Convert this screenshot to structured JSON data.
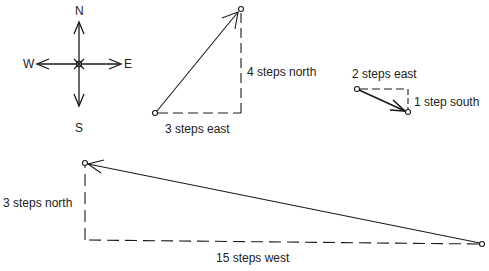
{
  "compass": {
    "north": "N",
    "south": "S",
    "east": "E",
    "west": "W"
  },
  "diagrams": [
    {
      "id": "triangle-1",
      "legs": [
        {
          "label": "3 steps east",
          "steps": 3,
          "direction": "east"
        },
        {
          "label": "4 steps north",
          "steps": 4,
          "direction": "north"
        }
      ]
    },
    {
      "id": "triangle-2",
      "legs": [
        {
          "label": "2 steps east",
          "steps": 2,
          "direction": "east"
        },
        {
          "label": "1 step south",
          "steps": 1,
          "direction": "south"
        }
      ]
    },
    {
      "id": "triangle-3",
      "legs": [
        {
          "label": "15 steps west",
          "steps": 15,
          "direction": "west"
        },
        {
          "label": "3 steps north",
          "steps": 3,
          "direction": "north"
        }
      ]
    }
  ],
  "colors": {
    "stroke": "#1a1a1a",
    "background": "#ffffff"
  }
}
